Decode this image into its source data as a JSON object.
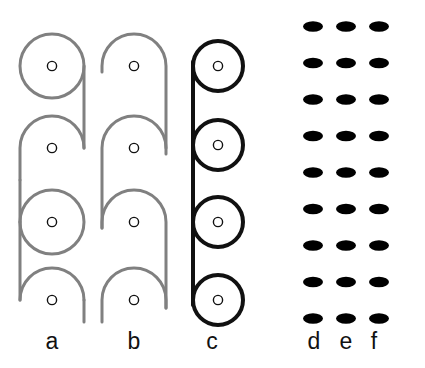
{
  "figure": {
    "background_color": "#ffffff",
    "width": 425,
    "height": 368,
    "panel_count": 6
  },
  "colors": {
    "schematic_gray": "#808080",
    "schematic_black": "#111111",
    "marker_outline": "#111111",
    "marker_fill": "#ffffff",
    "braid_dark": "#6e6e6e",
    "braid_mid": "#7a7a7a",
    "braid_light": "#b4b4b4",
    "braid_shadow": "#3a3a3a",
    "braid_highlight": "#dcdcdc",
    "label_color": "#111111"
  },
  "panels": [
    {
      "id": "a",
      "label": "a",
      "type": "schematic-line-drawing",
      "stroke_color": "#808080",
      "stroke_width": 3,
      "description": "Alternating full circles and open arches joined by a right-hand vertical connector",
      "element_count": 4,
      "elements": [
        {
          "kind": "circle",
          "cx": 52,
          "cy": 66,
          "r": 32,
          "marker": true
        },
        {
          "kind": "arch-up",
          "cx": 52,
          "cy": 148,
          "r": 32,
          "marker": true
        },
        {
          "kind": "circle",
          "cx": 52,
          "cy": 222,
          "r": 32,
          "marker": true
        },
        {
          "kind": "arch-up",
          "cx": 52,
          "cy": 300,
          "r": 32,
          "marker": true
        }
      ],
      "markers": [
        {
          "cx": 52,
          "cy": 66,
          "r": 5
        },
        {
          "cx": 52,
          "cy": 148,
          "r": 5
        },
        {
          "cx": 52,
          "cy": 222,
          "r": 5
        },
        {
          "cx": 52,
          "cy": 300,
          "r": 5
        }
      ]
    },
    {
      "id": "b",
      "label": "b",
      "type": "schematic-line-drawing",
      "stroke_color": "#808080",
      "stroke_width": 3,
      "description": "Series of open hook arches offset alternately left and right",
      "element_count": 4,
      "markers": [
        {
          "cx": 134,
          "cy": 66,
          "r": 5
        },
        {
          "cx": 134,
          "cy": 148,
          "r": 5
        },
        {
          "cx": 134,
          "cy": 222,
          "r": 5
        },
        {
          "cx": 134,
          "cy": 300,
          "r": 5
        }
      ]
    },
    {
      "id": "c",
      "label": "c",
      "type": "schematic-line-drawing",
      "stroke_color": "#111111",
      "stroke_width": 4,
      "description": "Bold vertical spine with four tangent circles on its right side",
      "element_count": 4,
      "spine": {
        "x": 193,
        "y1": 40,
        "y2": 305
      },
      "elements": [
        {
          "kind": "circle",
          "cx": 218,
          "cy": 66,
          "r": 26,
          "marker": true
        },
        {
          "kind": "circle",
          "cx": 218,
          "cy": 145,
          "r": 26,
          "marker": true
        },
        {
          "kind": "circle",
          "cx": 218,
          "cy": 222,
          "r": 26,
          "marker": true
        },
        {
          "kind": "circle",
          "cx": 218,
          "cy": 300,
          "r": 26,
          "marker": true
        }
      ],
      "markers": [
        {
          "cx": 218,
          "cy": 66,
          "r": 5
        },
        {
          "cx": 218,
          "cy": 145,
          "r": 5
        },
        {
          "cx": 218,
          "cy": 222,
          "r": 5
        },
        {
          "cx": 218,
          "cy": 300,
          "r": 5
        }
      ]
    },
    {
      "id": "d",
      "label": "d",
      "type": "rendered-braid",
      "tone": "dark",
      "base_color": "#6e6e6e",
      "shadow_color": "#3a3a3a",
      "highlight_color": "#c8c8c8",
      "strand_count": 3,
      "period": 73,
      "repeat_count": 5,
      "center_x": 313,
      "width": 44,
      "description": "Three-strand twisted chain, dark gray rendering"
    },
    {
      "id": "e",
      "label": "e",
      "type": "rendered-braid",
      "tone": "mid",
      "base_color": "#7a7a7a",
      "shadow_color": "#404040",
      "highlight_color": "#cfcfcf",
      "strand_count": 3,
      "period": 73,
      "repeat_count": 5,
      "center_x": 346,
      "width": 44,
      "description": "Three-strand twisted chain, medium gray rendering"
    },
    {
      "id": "f",
      "label": "f",
      "type": "rendered-braid",
      "tone": "light",
      "base_color": "#b4b4b4",
      "shadow_color": "#6a6a6a",
      "highlight_color": "#ededed",
      "strand_count": 3,
      "period": 73,
      "repeat_count": 5,
      "center_x": 379,
      "width": 44,
      "description": "Three-strand twisted chain, light gray rendering"
    }
  ],
  "labels": {
    "a": "a",
    "b": "b",
    "c": "c",
    "d": "d",
    "e": "e",
    "f": "f"
  }
}
